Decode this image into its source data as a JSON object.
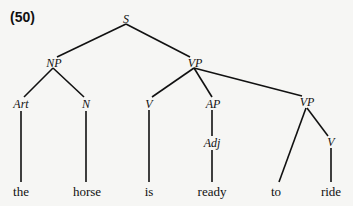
{
  "example_number": "(50)",
  "tree": {
    "nodes": {
      "S": "S",
      "NP": "NP",
      "VP": "VP",
      "Art": "Art",
      "N": "N",
      "V1": "V",
      "AP": "AP",
      "VP2": "VP",
      "Adj": "Adj",
      "V2": "V"
    },
    "leaves": {
      "the": "the",
      "horse": "horse",
      "is": "is",
      "ready": "ready",
      "to": "to",
      "ride": "ride"
    }
  }
}
